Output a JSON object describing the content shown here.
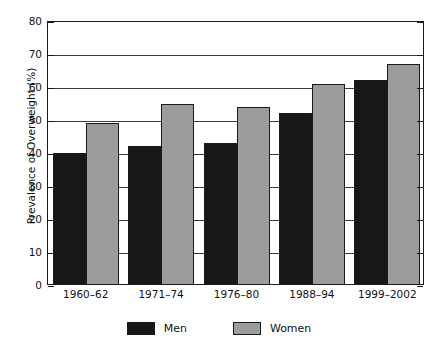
{
  "chart_data": {
    "type": "bar",
    "title": "",
    "xlabel": "",
    "ylabel": "Prevalence of Overweight (%)",
    "categories": [
      "1960–62",
      "1971–74",
      "1976–80",
      "1988–94",
      "1999–2002"
    ],
    "series": [
      {
        "name": "Men",
        "color": "#171717",
        "values": [
          40,
          42,
          43,
          52,
          62
        ]
      },
      {
        "name": "Women",
        "color": "#9c9c9c",
        "values": [
          49,
          55,
          54,
          61,
          67
        ]
      }
    ],
    "ylim": [
      0,
      80
    ],
    "ytick_labels": [
      "80",
      "70",
      "60",
      "50",
      "40",
      "30",
      "20",
      "10",
      "0"
    ],
    "ytick_values": [
      80,
      70,
      60,
      50,
      40,
      30,
      20,
      10,
      0
    ],
    "grid": "horizontal",
    "legend_position": "bottom-center"
  },
  "title_remnant": "",
  "legend": {
    "items": [
      {
        "label": "Men",
        "swatch": "black-swatch"
      },
      {
        "label": "Women",
        "swatch": "gray-swatch"
      }
    ]
  }
}
